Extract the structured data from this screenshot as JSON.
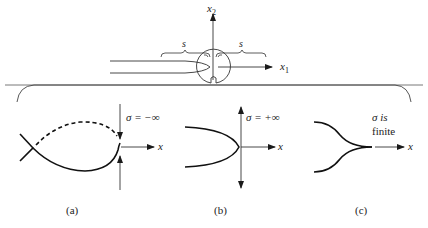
{
  "top_figure": {
    "axis_vertical_label": "x",
    "axis_vertical_sub": "2",
    "axis_horizontal_label": "x",
    "axis_horizontal_sub": "1",
    "brace_left_label": "s",
    "brace_right_label": "s"
  },
  "panels": [
    {
      "caption": "(a)",
      "sigma_label": "σ = −∞",
      "axis_label": "x"
    },
    {
      "caption": "(b)",
      "sigma_label": "σ = +∞",
      "axis_label": "x"
    },
    {
      "caption": "(c)",
      "sigma_line1": "σ is",
      "sigma_line2": "finite",
      "axis_label": "x"
    }
  ],
  "colors": {
    "line": "#1a1a1a",
    "thin_line": "#333333",
    "background": "#ffffff"
  }
}
